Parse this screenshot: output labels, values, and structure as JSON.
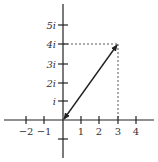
{
  "diagram": {
    "type": "complex-plane",
    "x_ticks": [
      {
        "label": "−2",
        "x": 26
      },
      {
        "label": "−1",
        "x": 44
      },
      {
        "label": "1",
        "x": 81
      },
      {
        "label": "2",
        "x": 99
      },
      {
        "label": "3",
        "x": 118
      },
      {
        "label": "4",
        "x": 136
      }
    ],
    "y_ticks": [
      {
        "label": "i",
        "y": 101
      },
      {
        "label": "2i",
        "y": 83
      },
      {
        "label": "3i",
        "y": 64
      },
      {
        "label": "4i",
        "y": 44
      },
      {
        "label": "5i",
        "y": 25
      },
      {
        "label": "",
        "y": 139
      }
    ],
    "vector": {
      "from": "0",
      "to": "3 + 4i"
    },
    "colors": {
      "axis": "#222222",
      "text": "#333333"
    }
  }
}
